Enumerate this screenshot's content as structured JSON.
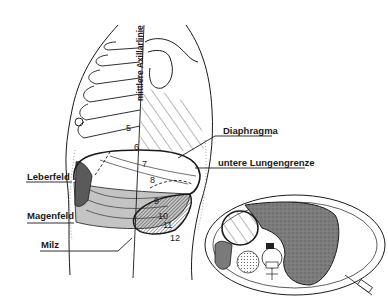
{
  "labels": {
    "axillary_line": "mittlere Axillarlinie",
    "diaphragm": "Diaphragma",
    "lower_lung_border": "untere Lungengrenze",
    "liver_field": "Leberfeld",
    "stomach_field": "Magenfeld",
    "spleen": "Milz"
  },
  "rib_numbers": [
    "5",
    "6",
    "7",
    "8",
    "9",
    "10",
    "11",
    "12"
  ],
  "colors": {
    "line": "#1a1a1a",
    "liver_field": "#5a5a5a",
    "stomach_field": "#c4c4c4",
    "spleen_hatch": "#3a3a3a",
    "cross_section_organ": "#7a7a7a",
    "background": "#ffffff"
  }
}
